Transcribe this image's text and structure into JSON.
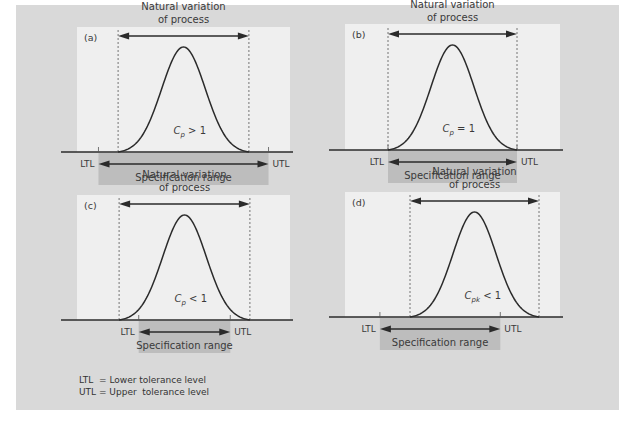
{
  "figure": {
    "background_color": "#d9d9d9",
    "panel_color": "#efefef",
    "spec_bar_color": "#bdbdbd",
    "curve_color": "#2b2b2b"
  },
  "legend": {
    "ltl": "LTL  = Lower tolerance level",
    "utl": "UTL = Upper  tolerance level"
  },
  "chart_data": [
    {
      "type": "diagram",
      "id": "a",
      "label": "(a)",
      "title": "Natural variation of process",
      "title_lines": [
        "Natural variation",
        "of process"
      ],
      "index_label_base": "C",
      "index_label_sub": "p",
      "index_label_rel": " > 1",
      "process_range": [
        -3,
        3
      ],
      "spec_range": [
        -3.9,
        3.9
      ],
      "ltl_label": "LTL",
      "utl_label": "UTL",
      "spec_label": "Specification range"
    },
    {
      "type": "diagram",
      "id": "b",
      "label": "(b)",
      "title": "Natural variation of process",
      "title_lines": [
        "Natural variation",
        "of process"
      ],
      "index_label_base": "C",
      "index_label_sub": "p",
      "index_label_rel": " = 1",
      "process_range": [
        -3,
        3
      ],
      "spec_range": [
        -3,
        3
      ],
      "ltl_label": "LTL",
      "utl_label": "UTL",
      "spec_label": "Specification range"
    },
    {
      "type": "diagram",
      "id": "c",
      "label": "(c)",
      "title": "Natural variation of process",
      "title_lines": [
        "Natural variation",
        "of process"
      ],
      "index_label_base": "C",
      "index_label_sub": "p",
      "index_label_rel": " < 1",
      "process_range": [
        -3,
        3
      ],
      "spec_range": [
        -2.1,
        2.1
      ],
      "ltl_label": "LTL",
      "utl_label": "UTL",
      "spec_label": "Specification range"
    },
    {
      "type": "diagram",
      "id": "d",
      "label": "(d)",
      "title": "Natural variation of process",
      "title_lines": [
        "Natural variation",
        "of process"
      ],
      "index_label_base": "C",
      "index_label_sub": "pk",
      "index_label_rel": " < 1",
      "process_range": [
        -3,
        3
      ],
      "spec_range": [
        -4.4,
        1.2
      ],
      "ltl_label": "LTL",
      "utl_label": "UTL",
      "spec_label": "Specification range"
    }
  ]
}
